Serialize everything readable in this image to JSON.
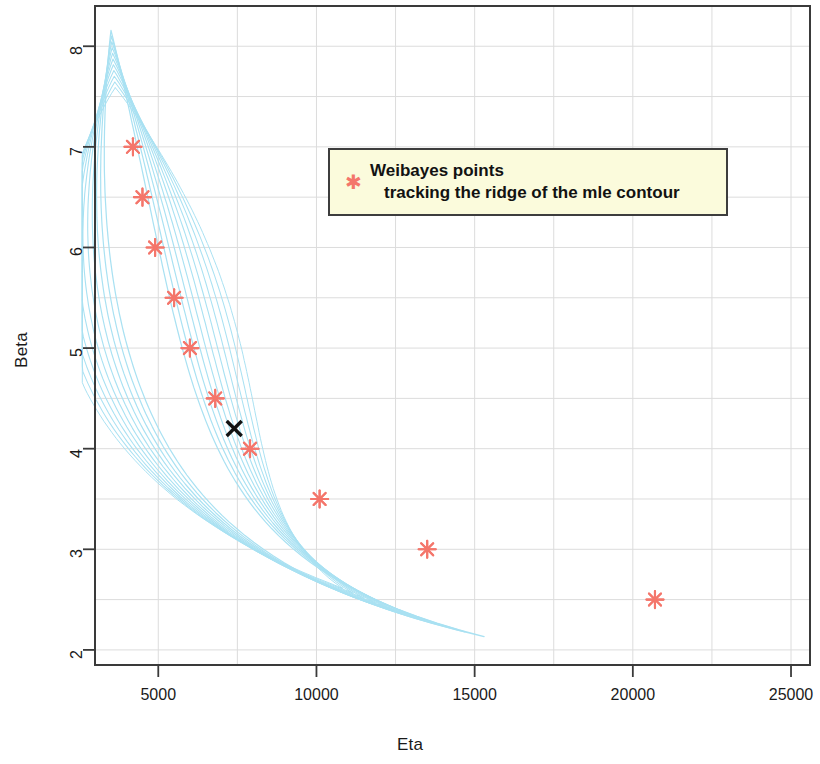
{
  "chart_data": {
    "type": "scatter",
    "title": "",
    "xlabel": "Eta",
    "ylabel": "Beta",
    "xlim": [
      3000,
      25600
    ],
    "ylim": [
      1.85,
      8.4
    ],
    "xticks": [
      5000,
      10000,
      15000,
      20000,
      25000
    ],
    "xtick_labels": [
      "5000",
      "10000",
      "15000",
      "20000",
      "25000"
    ],
    "yticks": [
      2,
      3,
      4,
      5,
      6,
      7,
      8
    ],
    "ytick_labels": [
      "2",
      "3",
      "4",
      "5",
      "6",
      "7",
      "8"
    ],
    "grid": true,
    "grid_color": "#dcdcdc",
    "grid_minor_spacing_x": 2500,
    "grid_minor_spacing_y": 0.5,
    "legend_position": "upper-center-right",
    "series": [
      {
        "name": "Weibayes points tracking the ridge of the mle contour",
        "type": "scatter",
        "marker": "asterisk",
        "color": "#f4766b",
        "points": [
          {
            "eta": 4200,
            "beta": 7.0
          },
          {
            "eta": 4500,
            "beta": 6.5
          },
          {
            "eta": 4900,
            "beta": 6.0
          },
          {
            "eta": 5500,
            "beta": 5.5
          },
          {
            "eta": 6000,
            "beta": 5.0
          },
          {
            "eta": 6800,
            "beta": 4.5
          },
          {
            "eta": 7900,
            "beta": 4.0
          },
          {
            "eta": 10100,
            "beta": 3.5
          },
          {
            "eta": 13500,
            "beta": 3.0
          },
          {
            "eta": 20700,
            "beta": 2.5
          }
        ]
      },
      {
        "name": "mle point",
        "type": "scatter",
        "marker": "x",
        "color": "#111111",
        "points": [
          {
            "eta": 7400,
            "beta": 4.2
          }
        ]
      },
      {
        "name": "likelihood contours",
        "type": "contour",
        "color": "#a9e1f2",
        "count": 11,
        "description": "nested likelihood-ratio contour loops converging near (4000, 8.2) and extending to (24800, 2.1)"
      }
    ]
  },
  "legend": {
    "marker_glyph": "✱",
    "line1": "Weibayes points",
    "line2": "tracking the ridge of the mle contour",
    "background": "#fbfbdc",
    "border": "#3d3d3d"
  },
  "axes": {
    "x_title": "Eta",
    "y_title": "Beta"
  },
  "colors": {
    "contour": "#a9e1f2",
    "marker": "#f4766b",
    "mle_marker": "#111111",
    "frame": "#3a3a3a",
    "grid": "#dcdcdc"
  }
}
